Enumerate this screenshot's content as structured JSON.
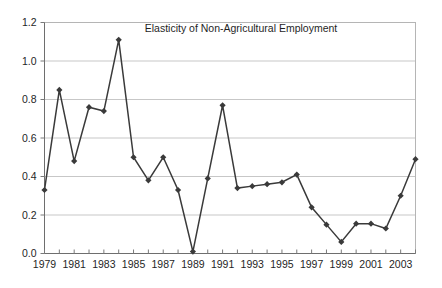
{
  "chart_data": {
    "type": "line",
    "title": "Elasticity of Non-Agricultural  Employment",
    "xlabel": "",
    "ylabel": "",
    "grid": "horizontal",
    "legend": "none",
    "marker": "diamond",
    "series_color": "#3a3a3a",
    "ylim": [
      0.0,
      1.2
    ],
    "ytick_step": 0.2,
    "ytick_labels": [
      "0.0",
      "0.2",
      "0.4",
      "0.6",
      "0.8",
      "1.0",
      "1.2"
    ],
    "ytick_values": [
      0.0,
      0.2,
      0.4,
      0.6,
      0.8,
      1.0,
      1.2
    ],
    "xlim": [
      1979,
      2004
    ],
    "xtick_labels": [
      "1979",
      "1981",
      "1983",
      "1985",
      "1987",
      "1989",
      "1991",
      "1993",
      "1995",
      "1997",
      "1999",
      "2001",
      "2003"
    ],
    "xtick_values": [
      1979,
      1981,
      1983,
      1985,
      1987,
      1989,
      1991,
      1993,
      1995,
      1997,
      1999,
      2001,
      2003
    ],
    "x": [
      1979,
      1980,
      1981,
      1982,
      1983,
      1984,
      1985,
      1986,
      1987,
      1988,
      1989,
      1990,
      1991,
      1992,
      1993,
      1994,
      1995,
      1996,
      1997,
      1998,
      1999,
      2000,
      2001,
      2002,
      2003,
      2004
    ],
    "values": [
      0.33,
      0.85,
      0.48,
      0.76,
      0.74,
      1.11,
      0.5,
      0.38,
      0.5,
      0.33,
      0.01,
      0.39,
      0.77,
      0.34,
      0.35,
      0.36,
      0.37,
      0.41,
      0.24,
      0.15,
      0.06,
      0.155,
      0.155,
      0.13,
      0.3,
      0.49
    ],
    "series": [
      {
        "name": "Elasticity of Non-Agricultural Employment",
        "values": [
          0.33,
          0.85,
          0.48,
          0.76,
          0.74,
          1.11,
          0.5,
          0.38,
          0.5,
          0.33,
          0.01,
          0.39,
          0.77,
          0.34,
          0.35,
          0.36,
          0.37,
          0.41,
          0.24,
          0.15,
          0.06,
          0.155,
          0.155,
          0.13,
          0.3,
          0.49
        ]
      }
    ]
  }
}
